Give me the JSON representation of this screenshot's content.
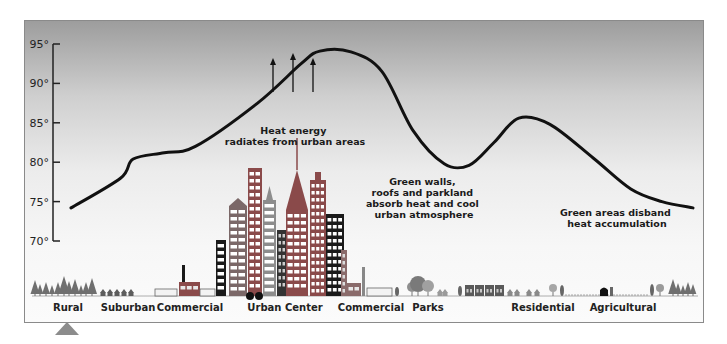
{
  "chart_data": {
    "type": "line",
    "title": "",
    "xlabel": "",
    "ylabel": "",
    "ylim": [
      70,
      95
    ],
    "yticks": [
      "95°",
      "90°",
      "85°",
      "80°",
      "75°",
      "70°"
    ],
    "ytick_values": [
      95,
      90,
      85,
      80,
      75,
      70
    ],
    "categories": [
      "Rural",
      "Suburban",
      "Commercial",
      "Urban Center",
      "Commercial",
      "Parks",
      "Residential",
      "Agricultural"
    ],
    "series": [
      {
        "name": "Temperature profile",
        "points": [
          {
            "x": 0.0,
            "y": 74.2
          },
          {
            "x": 0.08,
            "y": 78.0
          },
          {
            "x": 0.1,
            "y": 80.4
          },
          {
            "x": 0.15,
            "y": 81.2
          },
          {
            "x": 0.2,
            "y": 82.0
          },
          {
            "x": 0.3,
            "y": 87.5
          },
          {
            "x": 0.37,
            "y": 92.5
          },
          {
            "x": 0.4,
            "y": 94.1
          },
          {
            "x": 0.45,
            "y": 94.0
          },
          {
            "x": 0.5,
            "y": 91.5
          },
          {
            "x": 0.55,
            "y": 84.0
          },
          {
            "x": 0.6,
            "y": 79.8
          },
          {
            "x": 0.64,
            "y": 79.6
          },
          {
            "x": 0.68,
            "y": 82.5
          },
          {
            "x": 0.72,
            "y": 85.6
          },
          {
            "x": 0.77,
            "y": 84.8
          },
          {
            "x": 0.84,
            "y": 80.5
          },
          {
            "x": 0.9,
            "y": 76.6
          },
          {
            "x": 0.95,
            "y": 75.0
          },
          {
            "x": 1.0,
            "y": 74.2
          }
        ]
      }
    ],
    "annotations": [
      {
        "id": "heat",
        "lines": [
          "Heat energy",
          "radiates from urban areas"
        ]
      },
      {
        "id": "green",
        "lines": [
          "Green walls,",
          "roofs and parkland",
          "absorb heat and cool",
          "urban atmosphere"
        ]
      },
      {
        "id": "disband",
        "lines": [
          "Green areas disband",
          "heat accumulation"
        ]
      }
    ],
    "grid": false,
    "legend": "none"
  },
  "colors": {
    "curve": "#111111",
    "building_dark": "#1a1a1a",
    "building_red": "#8a4a4a",
    "building_gray": "#7a7a7a",
    "tree": "#6f6f6f"
  }
}
